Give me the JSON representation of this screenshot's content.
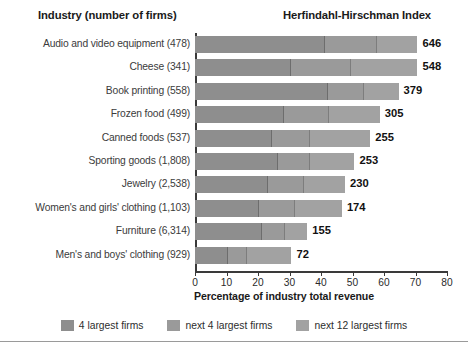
{
  "header": {
    "left_title": "Industry (number of firms)",
    "right_title": "Herfindahl-Hirschman Index"
  },
  "axis": {
    "x_title": "Percentage of industry total revenue",
    "ticks": [
      "0",
      "10",
      "20",
      "30",
      "40",
      "50",
      "60",
      "70",
      "80"
    ],
    "x_min": 0,
    "x_max": 80
  },
  "legend": {
    "items": [
      {
        "label": "4 largest firms",
        "color": "#8e8e8e"
      },
      {
        "label": "next 4 largest firms",
        "color": "#9a9a9a"
      },
      {
        "label": "next 12 largest firms",
        "color": "#a2a2a2"
      }
    ]
  },
  "chart_data": {
    "type": "bar",
    "orientation": "horizontal",
    "stacked": true,
    "title": "",
    "xlabel": "Percentage of industry total revenue",
    "ylabel": "Industry (number of firms)",
    "xlim": [
      0,
      80
    ],
    "grid": false,
    "legend_position": "bottom",
    "categories": [
      "Audio and video equipment (478)",
      "Cheese (341)",
      "Book printing (558)",
      "Frozen food (499)",
      "Canned foods (537)",
      "Sporting goods (1,808)",
      "Jewelry (2,538)",
      "Women's and girls' clothing (1,103)",
      "Furniture (6,314)",
      "Men's and boys' clothing (929)"
    ],
    "value_labels": [
      646,
      548,
      379,
      305,
      255,
      253,
      230,
      174,
      155,
      72
    ],
    "value_label_name": "Herfindahl-Hirschman Index",
    "series": [
      {
        "name": "4 largest firms",
        "color": "#8e8e8e",
        "values": [
          41,
          30,
          42,
          28,
          24,
          26,
          23,
          20,
          21,
          10
        ]
      },
      {
        "name": "next 4 largest firms",
        "color": "#9a9a9a",
        "values": [
          16,
          19,
          11,
          14,
          12,
          10,
          11,
          11,
          7,
          6
        ]
      },
      {
        "name": "next 12 largest firms",
        "color": "#a2a2a2",
        "values": [
          13,
          21,
          11,
          16,
          19,
          14,
          13,
          15,
          7,
          14
        ]
      }
    ],
    "totals": [
      70,
      70,
      64,
      58,
      55,
      50,
      47,
      46,
      35,
      30
    ]
  }
}
